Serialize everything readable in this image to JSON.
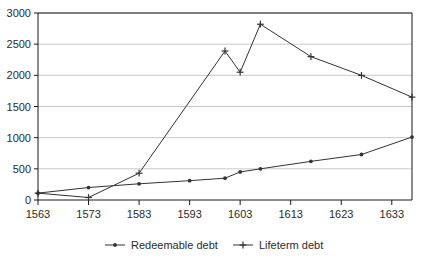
{
  "chart_data": {
    "type": "line",
    "title": "",
    "xlabel": "",
    "ylabel": "",
    "xlim": [
      1563,
      1637
    ],
    "ylim": [
      0,
      3000
    ],
    "grid": "horizontal",
    "legend_position": "bottom",
    "x_ticks": [
      1563,
      1573,
      1583,
      1593,
      1603,
      1613,
      1623,
      1633
    ],
    "y_ticks": [
      0,
      500,
      1000,
      1500,
      2000,
      2500,
      3000
    ],
    "series": [
      {
        "name": "Redeemable debt",
        "marker": "dot",
        "color": "#333333",
        "points": [
          {
            "x": 1563,
            "y": 110
          },
          {
            "x": 1573,
            "y": 200
          },
          {
            "x": 1583,
            "y": 260
          },
          {
            "x": 1593,
            "y": 310
          },
          {
            "x": 1600,
            "y": 350
          },
          {
            "x": 1603,
            "y": 450
          },
          {
            "x": 1607,
            "y": 500
          },
          {
            "x": 1617,
            "y": 620
          },
          {
            "x": 1627,
            "y": 730
          },
          {
            "x": 1637,
            "y": 1010
          }
        ]
      },
      {
        "name": "Lifeterm debt",
        "marker": "plus",
        "color": "#333333",
        "points": [
          {
            "x": 1563,
            "y": 110
          },
          {
            "x": 1573,
            "y": 40
          },
          {
            "x": 1583,
            "y": 430
          },
          {
            "x": 1600,
            "y": 2390
          },
          {
            "x": 1603,
            "y": 2050
          },
          {
            "x": 1607,
            "y": 2820
          },
          {
            "x": 1617,
            "y": 2300
          },
          {
            "x": 1627,
            "y": 2000
          },
          {
            "x": 1637,
            "y": 1650
          }
        ]
      }
    ]
  },
  "legend": {
    "items": [
      {
        "label": "Redeemable debt",
        "marker": "dot"
      },
      {
        "label": "Lifeterm debt",
        "marker": "plus"
      }
    ]
  },
  "axis_labels": {
    "y": [
      "3000",
      "2500",
      "2000",
      "1500",
      "1000",
      "500",
      "0"
    ],
    "x": [
      "1563",
      "1573",
      "1583",
      "1593",
      "1603",
      "1613",
      "1623",
      "1633"
    ]
  },
  "colors": {
    "line": "#333333",
    "grid": "#c8c8c8",
    "axis": "#1a1a1a",
    "background": "#ffffff",
    "text": "#2b2b2b"
  }
}
